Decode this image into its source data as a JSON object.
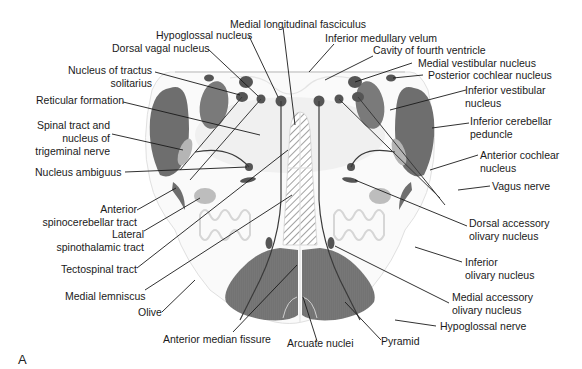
{
  "figure": {
    "panel_label": "A",
    "colors": {
      "dark_gray": "#707070",
      "medium_gray": "#8a8a8a",
      "light_gray": "#bdbdbd",
      "nucleus_dark": "#555555",
      "outline": "#dcdcdc",
      "leader_line": "#1a1a1a",
      "hatch": "#8a8a8a"
    }
  },
  "labels": {
    "left": [
      {
        "id": "medial-longitudinal-fasciculus",
        "text": "Medial longitudinal fasciculus"
      },
      {
        "id": "hypoglossal-nucleus",
        "text": "Hypoglossal nucleus"
      },
      {
        "id": "dorsal-vagal-nucleus",
        "text": "Dorsal vagal nucleus"
      },
      {
        "id": "nucleus-tractus-solitarius",
        "text": "Nucleus of tractus",
        "text2": "solitarius"
      },
      {
        "id": "reticular-formation",
        "text": "Reticular formation"
      },
      {
        "id": "spinal-tract-trigeminal",
        "text": "Spinal tract and",
        "text2": "nucleus of",
        "text3": "trigeminal nerve"
      },
      {
        "id": "nucleus-ambiguus",
        "text": "Nucleus ambiguus"
      },
      {
        "id": "anterior-spinocerebellar-tract",
        "text": "Anterior",
        "text2": "spinocerebellar tract"
      },
      {
        "id": "lateral-spinothalamic-tract",
        "text": "Lateral",
        "text2": "spinothalamic tract"
      },
      {
        "id": "tectospinal-tract",
        "text": "Tectospinal tract"
      },
      {
        "id": "medial-lemniscus",
        "text": "Medial lemniscus"
      },
      {
        "id": "olive",
        "text": "Olive"
      },
      {
        "id": "anterior-median-fissure",
        "text": "Anterior median fissure"
      }
    ],
    "right": [
      {
        "id": "inferior-medullary-velum",
        "text": "Inferior medullary velum"
      },
      {
        "id": "cavity-fourth-ventricle",
        "text": "Cavity of fourth ventricle"
      },
      {
        "id": "medial-vestibular-nucleus",
        "text": "Medial vestibular nucleus"
      },
      {
        "id": "posterior-cochlear-nucleus",
        "text": "Posterior cochlear nucleus"
      },
      {
        "id": "inferior-vestibular-nucleus",
        "text": "Inferior vestibular",
        "text2": "nucleus"
      },
      {
        "id": "inferior-cerebellar-peduncle",
        "text": "Inferior cerebellar",
        "text2": "peduncle"
      },
      {
        "id": "anterior-cochlear-nucleus",
        "text": "Anterior cochlear",
        "text2": "nucleus"
      },
      {
        "id": "vagus-nerve",
        "text": "Vagus nerve"
      },
      {
        "id": "dorsal-accessory-olivary-nucleus",
        "text": "Dorsal accessory",
        "text2": "olivary nucleus"
      },
      {
        "id": "inferior-olivary-nucleus",
        "text": "Inferior",
        "text2": "olivary nucleus"
      },
      {
        "id": "medial-accessory-olivary-nucleus",
        "text": "Medial accessory",
        "text2": "olivary nucleus"
      },
      {
        "id": "hypoglossal-nerve",
        "text": "Hypoglossal nerve"
      },
      {
        "id": "pyramid",
        "text": "Pyramid"
      },
      {
        "id": "arcuate-nuclei",
        "text": "Arcuate nuclei"
      }
    ]
  }
}
